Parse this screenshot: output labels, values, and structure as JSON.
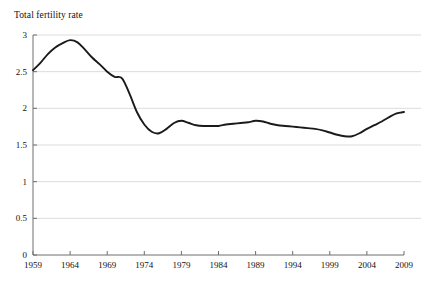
{
  "chart_data": {
    "type": "line",
    "title": "Total fertility rate",
    "xlabel": "",
    "ylabel": "Total fertility rate",
    "xlim": [
      1959,
      2009
    ],
    "ylim": [
      0,
      3
    ],
    "grid": true,
    "legend": "none",
    "y_ticks": [
      "0",
      "0.5",
      "1",
      "1.5",
      "2",
      "2.5",
      "3"
    ],
    "y_tick_values": [
      0,
      0.5,
      1,
      1.5,
      2,
      2.5,
      3
    ],
    "x_ticks": [
      "1959",
      "1964",
      "1969",
      "1974",
      "1979",
      "1984",
      "1989",
      "1994",
      "1999",
      "2004",
      "2009"
    ],
    "x_tick_values": [
      1959,
      1964,
      1969,
      1974,
      1979,
      1984,
      1989,
      1994,
      1999,
      2004,
      2009
    ],
    "series": [
      {
        "name": "Total fertility rate",
        "color": "#1a1a1a",
        "x": [
          1959,
          1960,
          1961,
          1962,
          1963,
          1964,
          1965,
          1966,
          1967,
          1968,
          1969,
          1970,
          1971,
          1972,
          1973,
          1974,
          1975,
          1976,
          1977,
          1978,
          1979,
          1980,
          1981,
          1982,
          1983,
          1984,
          1985,
          1986,
          1987,
          1988,
          1989,
          1990,
          1991,
          1992,
          1993,
          1994,
          1995,
          1996,
          1997,
          1998,
          1999,
          2000,
          2001,
          2002,
          2003,
          2004,
          2005,
          2006,
          2007,
          2008,
          2009
        ],
        "values": [
          2.52,
          2.62,
          2.74,
          2.83,
          2.89,
          2.93,
          2.9,
          2.8,
          2.69,
          2.6,
          2.5,
          2.43,
          2.41,
          2.2,
          1.95,
          1.78,
          1.68,
          1.66,
          1.72,
          1.8,
          1.83,
          1.8,
          1.77,
          1.76,
          1.76,
          1.76,
          1.78,
          1.79,
          1.8,
          1.81,
          1.83,
          1.82,
          1.79,
          1.77,
          1.76,
          1.75,
          1.74,
          1.73,
          1.72,
          1.7,
          1.67,
          1.64,
          1.62,
          1.62,
          1.66,
          1.72,
          1.77,
          1.82,
          1.88,
          1.93,
          1.95
        ]
      }
    ]
  },
  "axes": {
    "y_title": "Total fertility rate"
  }
}
